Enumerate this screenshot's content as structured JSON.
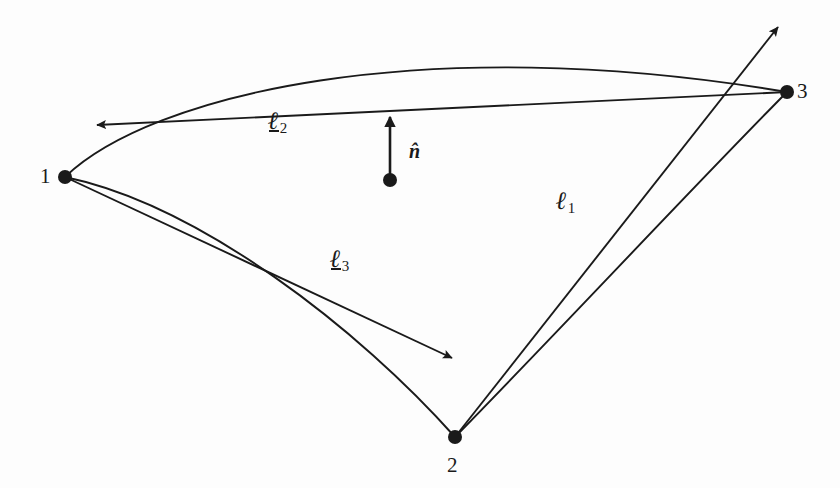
{
  "figure": {
    "background_color": "#fdfdfd",
    "ink_color": "#1a1a1a"
  },
  "vertices": [
    {
      "id": "1",
      "label": "1",
      "x": 65,
      "y": 177,
      "label_x": 40,
      "label_y": 166,
      "radius": 7
    },
    {
      "id": "2",
      "label": "2",
      "x": 455,
      "y": 437,
      "label_x": 447,
      "label_y": 455,
      "radius": 7
    },
    {
      "id": "3",
      "label": "3",
      "x": 787,
      "y": 92,
      "label_x": 797,
      "label_y": 81,
      "radius": 7
    }
  ],
  "edges": [
    {
      "name": "curve-1-to-3",
      "from": "1",
      "to": "3",
      "path": "M 65 177 C 150 95 420 30 787 92",
      "curved": true
    },
    {
      "name": "curve-1-to-2",
      "from": "1",
      "to": "2",
      "path": "M 65 177 C 200 205 360 330 455 437",
      "curved": true
    },
    {
      "name": "curve-2-to-3",
      "from": "2",
      "to": "3",
      "path": "M 455 437 C 560 330 690 190 787 92",
      "curved": true
    }
  ],
  "vectors": [
    {
      "name": "ell-1",
      "symbol": "ℓ",
      "subscript": "1",
      "underlined": false,
      "from": "2",
      "start_x": 455,
      "start_y": 437,
      "end_x": 778,
      "end_y": 27,
      "label_x": 556,
      "label_y": 188
    },
    {
      "name": "ell-2",
      "symbol": "ℓ",
      "subscript": "2",
      "underlined": true,
      "from": "3",
      "start_x": 787,
      "start_y": 92,
      "end_x": 97,
      "end_y": 125,
      "label_x": 268,
      "label_y": 108
    },
    {
      "name": "ell-3",
      "symbol": "ℓ",
      "subscript": "3",
      "underlined": true,
      "from": "1",
      "start_x": 65,
      "start_y": 177,
      "end_x": 452,
      "end_y": 358,
      "label_x": 330,
      "label_y": 246
    }
  ],
  "normal": {
    "name": "unit-normal",
    "symbol": "n̂",
    "base_x": 390,
    "base_y": 180,
    "tip_x": 390,
    "tip_y": 117,
    "dot_radius": 7,
    "label_x": 409,
    "label_y": 141
  }
}
